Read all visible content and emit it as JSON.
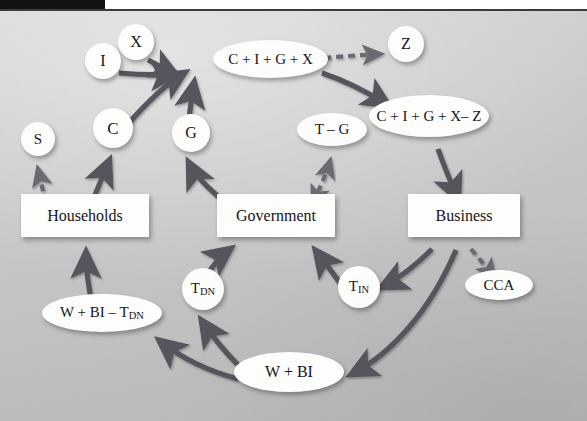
{
  "figure": {
    "type": "circular-flow-diagram",
    "title": "",
    "background_color": "#c6c6c6",
    "arrow_color": "#55555d",
    "node_fill": "#fdfdfb",
    "text_color": "#15151a"
  },
  "nodes": [
    {
      "id": "X",
      "label": "X",
      "shape": "circle",
      "x": 118,
      "y": 24,
      "w": 36,
      "h": 36
    },
    {
      "id": "I",
      "label": "I",
      "shape": "circle",
      "x": 85,
      "y": 43,
      "w": 36,
      "h": 36
    },
    {
      "id": "CIGX",
      "label": "C + I + G + X",
      "shape": "ellipse",
      "x": 213,
      "y": 40,
      "w": 115,
      "h": 38
    },
    {
      "id": "Z",
      "label": "Z",
      "shape": "circle",
      "x": 388,
      "y": 26,
      "w": 36,
      "h": 36
    },
    {
      "id": "CIGXZ",
      "label": "C + I + G + X– Z",
      "shape": "ellipse",
      "x": 369,
      "y": 95,
      "w": 120,
      "h": 42
    },
    {
      "id": "C",
      "label": "C",
      "shape": "circle",
      "x": 93,
      "y": 108,
      "w": 40,
      "h": 40
    },
    {
      "id": "G",
      "label": "G",
      "shape": "circle",
      "x": 172,
      "y": 114,
      "w": 38,
      "h": 38
    },
    {
      "id": "TG",
      "label": "T – G",
      "shape": "ellipse",
      "x": 297,
      "y": 113,
      "w": 70,
      "h": 33
    },
    {
      "id": "S",
      "label": "S",
      "shape": "circle",
      "x": 21,
      "y": 122,
      "w": 34,
      "h": 34
    },
    {
      "id": "Households",
      "label": "Households",
      "shape": "box",
      "x": 21,
      "y": 194,
      "w": 128,
      "h": 43
    },
    {
      "id": "Government",
      "label": "Government",
      "shape": "box",
      "x": 217,
      "y": 194,
      "w": 118,
      "h": 43
    },
    {
      "id": "Business",
      "label": "Business",
      "shape": "box",
      "x": 408,
      "y": 194,
      "w": 112,
      "h": 43
    },
    {
      "id": "TDN",
      "label": "T",
      "sublabel": "DN",
      "shape": "circle",
      "x": 182,
      "y": 268,
      "w": 42,
      "h": 42
    },
    {
      "id": "TIN",
      "label": "T",
      "sublabel": "IN",
      "shape": "circle",
      "x": 338,
      "y": 266,
      "w": 42,
      "h": 42
    },
    {
      "id": "CCA",
      "label": "CCA",
      "shape": "ellipse",
      "x": 465,
      "y": 270,
      "w": 68,
      "h": 30
    },
    {
      "id": "WBITDN",
      "label": "W + BI – T",
      "sublabel": "DN",
      "shape": "ellipse",
      "x": 42,
      "y": 294,
      "w": 120,
      "h": 38
    },
    {
      "id": "WBI",
      "label": "W + BI",
      "shape": "ellipse",
      "x": 234,
      "y": 352,
      "w": 110,
      "h": 40
    }
  ],
  "edges": [
    {
      "from": "X",
      "to": "CIGX",
      "style": "solid",
      "label": ""
    },
    {
      "from": "I",
      "to": "CIGX",
      "style": "solid",
      "label": ""
    },
    {
      "from": "C",
      "to": "CIGX",
      "style": "solid",
      "label": ""
    },
    {
      "from": "G",
      "to": "CIGX",
      "style": "solid",
      "label": ""
    },
    {
      "from": "CIGX",
      "to": "Z",
      "style": "dashed",
      "label": ""
    },
    {
      "from": "CIGX",
      "to": "CIGXZ",
      "style": "solid",
      "label": ""
    },
    {
      "from": "CIGXZ",
      "to": "Business",
      "style": "solid",
      "label": ""
    },
    {
      "from": "Households",
      "to": "S",
      "style": "dashed",
      "label": ""
    },
    {
      "from": "Households",
      "to": "C",
      "style": "solid",
      "label": ""
    },
    {
      "from": "Government",
      "to": "G",
      "style": "solid",
      "label": ""
    },
    {
      "from": "Government",
      "to": "TG",
      "style": "dashed-double",
      "label": ""
    },
    {
      "from": "Business",
      "to": "CCA",
      "style": "dashed",
      "label": ""
    },
    {
      "from": "Business",
      "to": "TIN",
      "style": "solid",
      "label": ""
    },
    {
      "from": "TIN",
      "to": "Government",
      "style": "solid",
      "label": ""
    },
    {
      "from": "Business",
      "to": "WBI",
      "style": "solid",
      "label": ""
    },
    {
      "from": "WBI",
      "to": "TDN",
      "style": "solid",
      "label": ""
    },
    {
      "from": "TDN",
      "to": "Government",
      "style": "solid",
      "label": ""
    },
    {
      "from": "WBI",
      "to": "WBITDN",
      "style": "solid",
      "label": ""
    },
    {
      "from": "WBITDN",
      "to": "Households",
      "style": "solid",
      "label": ""
    }
  ]
}
